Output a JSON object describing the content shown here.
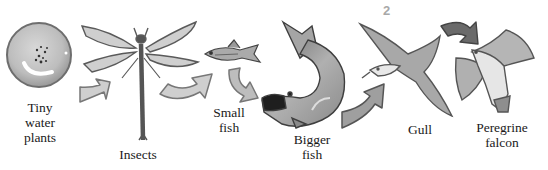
{
  "diagram": {
    "type": "food-chain",
    "page_number": "2",
    "nodes": [
      {
        "id": "tiny-water-plants",
        "label": "Tiny\nwater\nplants"
      },
      {
        "id": "insects",
        "label": "Insects"
      },
      {
        "id": "small-fish",
        "label": "Small\nfish"
      },
      {
        "id": "bigger-fish",
        "label": "Bigger\nfish"
      },
      {
        "id": "gull",
        "label": "Gull"
      },
      {
        "id": "peregrine-falcon",
        "label": "Peregrine\nfalcon"
      }
    ],
    "edges": [
      {
        "from": "tiny-water-plants",
        "to": "insects"
      },
      {
        "from": "insects",
        "to": "small-fish"
      },
      {
        "from": "small-fish",
        "to": "bigger-fish"
      },
      {
        "from": "bigger-fish",
        "to": "gull"
      },
      {
        "from": "gull",
        "to": "peregrine-falcon"
      }
    ],
    "colors": {
      "ink": "#1a1a1a",
      "wash_light": "#d6d6d6",
      "wash_mid": "#a9a9a9",
      "wash_dark": "#5a5a5a",
      "page_number": "#a8a8a8"
    }
  }
}
